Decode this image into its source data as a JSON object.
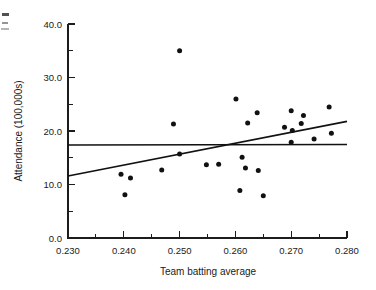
{
  "figure": {
    "background_color": "#ffffff",
    "ink_color": "#111111"
  },
  "chart_data": {
    "type": "scatter",
    "title": "",
    "xlabel": "Team batting average",
    "ylabel": "Attendance (100,000s)",
    "xlim": [
      0.23,
      0.28
    ],
    "ylim": [
      0.0,
      40.0
    ],
    "grid": false,
    "legend": "none",
    "x_ticks": [
      0.23,
      0.24,
      0.25,
      0.26,
      0.27,
      0.28
    ],
    "x_tick_labels": [
      "0.230",
      "0.240",
      "0.250",
      "0.260",
      "0.270",
      "0.280"
    ],
    "x_minor_ticks": [
      0.235,
      0.245,
      0.255,
      0.265,
      0.275
    ],
    "y_ticks": [
      0.0,
      10.0,
      20.0,
      30.0,
      40.0
    ],
    "y_tick_labels": [
      "0.0",
      "10.0",
      "20.0",
      "30.0",
      "40.0"
    ],
    "y_minor_ticks": [
      5.0,
      15.0,
      25.0,
      35.0
    ],
    "points": [
      {
        "x": 0.2395,
        "y": 11.9
      },
      {
        "x": 0.2402,
        "y": 8.1
      },
      {
        "x": 0.2412,
        "y": 11.2
      },
      {
        "x": 0.2468,
        "y": 12.7
      },
      {
        "x": 0.2489,
        "y": 21.3
      },
      {
        "x": 0.25,
        "y": 35.0
      },
      {
        "x": 0.25,
        "y": 15.7
      },
      {
        "x": 0.2548,
        "y": 13.7
      },
      {
        "x": 0.257,
        "y": 13.8
      },
      {
        "x": 0.2601,
        "y": 26.0
      },
      {
        "x": 0.2608,
        "y": 8.9
      },
      {
        "x": 0.2612,
        "y": 15.1
      },
      {
        "x": 0.2618,
        "y": 13.1
      },
      {
        "x": 0.2622,
        "y": 21.5
      },
      {
        "x": 0.2639,
        "y": 23.4
      },
      {
        "x": 0.2641,
        "y": 12.6
      },
      {
        "x": 0.265,
        "y": 7.9
      },
      {
        "x": 0.2688,
        "y": 20.7
      },
      {
        "x": 0.27,
        "y": 23.8
      },
      {
        "x": 0.2702,
        "y": 20.1
      },
      {
        "x": 0.27,
        "y": 17.9
      },
      {
        "x": 0.2718,
        "y": 21.4
      },
      {
        "x": 0.2722,
        "y": 22.9
      },
      {
        "x": 0.2741,
        "y": 18.5
      },
      {
        "x": 0.2768,
        "y": 24.5
      },
      {
        "x": 0.2772,
        "y": 19.6
      }
    ],
    "lines": [
      {
        "name": "regression-line",
        "x0": 0.23,
        "y0": 11.6,
        "x1": 0.28,
        "y1": 21.8
      },
      {
        "name": "mean-line",
        "x0": 0.23,
        "y0": 17.4,
        "x1": 0.28,
        "y1": 17.5
      }
    ]
  }
}
